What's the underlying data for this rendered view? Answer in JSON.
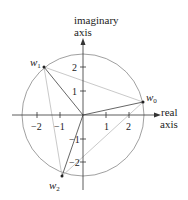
{
  "diagram": {
    "axes": {
      "imaginary_label_line1": "imaginary",
      "imaginary_label_line2": "axis",
      "real_label_line1": "real",
      "real_label_line2": "axis",
      "real_ticks": [
        "−2",
        "−1",
        "1",
        "2"
      ],
      "imag_ticks": [
        "2",
        "1",
        "−1",
        "−2"
      ]
    },
    "points": [
      {
        "name": "w",
        "sub": "0"
      },
      {
        "name": "w",
        "sub": "1"
      },
      {
        "name": "w",
        "sub": "2"
      }
    ],
    "colors": {
      "axis": "#333333",
      "circle": "#888888",
      "radius": "#555555",
      "triangle": "#bbbbbb"
    }
  }
}
